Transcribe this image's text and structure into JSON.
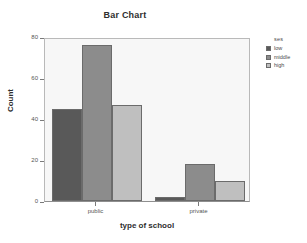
{
  "chart_data": {
    "type": "bar",
    "title": "Bar Chart",
    "xlabel": "type of school",
    "ylabel": "Count",
    "categories": [
      "public",
      "private"
    ],
    "series": [
      {
        "name": "low",
        "values": [
          45,
          2
        ],
        "color": "#595959"
      },
      {
        "name": "middle",
        "values": [
          76,
          18
        ],
        "color": "#8c8c8c"
      },
      {
        "name": "high",
        "values": [
          47,
          10
        ],
        "color": "#bfbfbf"
      }
    ],
    "ylim": [
      0,
      80
    ],
    "yticks": [
      0,
      20,
      40,
      60,
      80
    ],
    "ytick_labels": [
      "0",
      "20",
      "40",
      "60",
      "80"
    ],
    "grid": false,
    "legend": {
      "title": "ses",
      "position": "right",
      "entries": [
        {
          "label": "low",
          "color": "#595959"
        },
        {
          "label": "middle",
          "color": "#8c8c8c"
        },
        {
          "label": "high",
          "color": "#bfbfbf"
        }
      ]
    },
    "plot_background": "#f7f7f7",
    "page_background": "#ffffff"
  }
}
